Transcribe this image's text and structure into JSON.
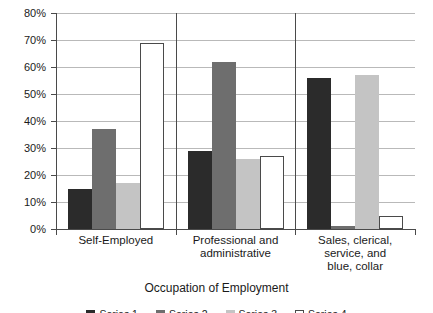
{
  "chart_data": {
    "type": "bar",
    "title": "",
    "xlabel": "Occupation of Employment",
    "ylabel": "",
    "ylim": [
      0,
      80
    ],
    "ytick_values": [
      0,
      10,
      20,
      30,
      40,
      50,
      60,
      70,
      80
    ],
    "ytick_labels": [
      "0%",
      "10%",
      "20%",
      "30%",
      "40%",
      "50%",
      "60%",
      "70%",
      "80%"
    ],
    "grid": "horizontal",
    "legend_position": "bottom",
    "legend_visible": false,
    "legend_note": "Legend row is clipped by the bottom edge of the image; labels are not legible.",
    "categories": [
      "Self-Employed",
      "Professional and administrative",
      "Sales, clerical, service, and blue, collar"
    ],
    "category_lines": [
      [
        "Self-Employed"
      ],
      [
        "Professional and",
        "administrative"
      ],
      [
        "Sales, clerical,",
        "service, and",
        "blue, collar"
      ]
    ],
    "series": [
      {
        "name": "Series 1",
        "color": "#2b2b2b",
        "values": [
          15,
          29,
          56
        ]
      },
      {
        "name": "Series 2",
        "color": "#6e6e6e",
        "values": [
          37,
          62,
          1
        ]
      },
      {
        "name": "Series 3",
        "color": "#c4c4c4",
        "values": [
          17,
          26,
          57
        ]
      },
      {
        "name": "Series 4",
        "color": "#ffffff",
        "values": [
          69,
          27,
          5
        ]
      }
    ]
  },
  "axis_title": "Occupation of Employment",
  "colors": {
    "series_1": "#2b2b2b",
    "series_2": "#6e6e6e",
    "series_3": "#c4c4c4",
    "series_4": "#ffffff",
    "axis": "#4a4a4a",
    "grid": "#b9b9b9",
    "background": "#ffffff"
  }
}
